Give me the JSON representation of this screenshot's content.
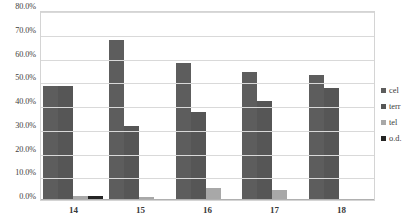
{
  "chart_data": {
    "type": "bar",
    "title": "",
    "xlabel": "",
    "ylabel": "",
    "categories": [
      "14",
      "15",
      "16",
      "17",
      "18"
    ],
    "ylim": [
      0,
      80
    ],
    "ytick_labels": [
      "80.0%",
      "70.0%",
      "60.0%",
      "50.0%",
      "40.0%",
      "30.0%",
      "20.0%",
      "10.0%",
      "0.0%"
    ],
    "ytick_values": [
      80,
      70,
      60,
      50,
      40,
      30,
      20,
      10,
      0
    ],
    "grid": true,
    "legend_position": "right",
    "series": [
      {
        "name": "cel",
        "color": "#5d5d5d",
        "values": [
          48.2,
          67.5,
          57.5,
          54.0,
          52.5
        ]
      },
      {
        "name": "terr",
        "color": "#565656",
        "values": [
          48.2,
          31.0,
          37.0,
          41.5,
          47.3
        ]
      },
      {
        "name": "tel",
        "color": "#a8a8a8",
        "values": [
          1.6,
          1.3,
          5.2,
          4.2,
          0.0
        ]
      },
      {
        "name": "o.d.",
        "color": "#242424",
        "values": [
          1.7,
          0.0,
          0.0,
          0.0,
          0.0
        ]
      }
    ]
  },
  "legend": {
    "items": [
      {
        "label": "cel"
      },
      {
        "label": "terr"
      },
      {
        "label": "tel"
      },
      {
        "label": "o.d."
      }
    ]
  }
}
